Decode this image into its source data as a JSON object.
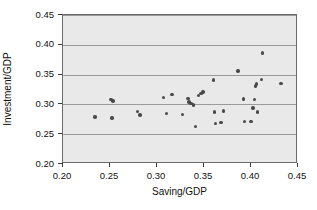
{
  "chart_data": {
    "type": "scatter",
    "title": "",
    "xlabel": "Saving/GDP",
    "ylabel": "Investment/GDP",
    "xlim": [
      0.2,
      0.45
    ],
    "ylim": [
      0.2,
      0.45
    ],
    "xticks": [
      "0.20",
      "0.25",
      "0.30",
      "0.35",
      "0.40",
      "0.45"
    ],
    "xtick_values": [
      0.2,
      0.25,
      0.3,
      0.35,
      0.4,
      0.45
    ],
    "yticks": [
      "0.20",
      "0.25",
      "0.30",
      "0.35",
      "0.40",
      "0.45"
    ],
    "ytick_values": [
      0.2,
      0.25,
      0.3,
      0.35,
      0.4,
      0.45
    ],
    "grid": "horizontal",
    "legend": "none",
    "marker": "filled-circle",
    "marker_color": "#4a4a4a",
    "plot_background": "#e9e9e9",
    "gridline_color": "#9a9a9a",
    "points": [
      {
        "x": 0.234,
        "y": 0.279
      },
      {
        "x": 0.251,
        "y": 0.308
      },
      {
        "x": 0.253,
        "y": 0.306
      },
      {
        "x": 0.252,
        "y": 0.277
      },
      {
        "x": 0.279,
        "y": 0.288
      },
      {
        "x": 0.282,
        "y": 0.282
      },
      {
        "x": 0.307,
        "y": 0.312
      },
      {
        "x": 0.31,
        "y": 0.285
      },
      {
        "x": 0.316,
        "y": 0.317
      },
      {
        "x": 0.327,
        "y": 0.283
      },
      {
        "x": 0.333,
        "y": 0.31
      },
      {
        "x": 0.334,
        "y": 0.304
      },
      {
        "x": 0.336,
        "y": 0.302
      },
      {
        "x": 0.339,
        "y": 0.299
      },
      {
        "x": 0.341,
        "y": 0.263
      },
      {
        "x": 0.344,
        "y": 0.315
      },
      {
        "x": 0.347,
        "y": 0.318
      },
      {
        "x": 0.349,
        "y": 0.321
      },
      {
        "x": 0.36,
        "y": 0.341
      },
      {
        "x": 0.361,
        "y": 0.287
      },
      {
        "x": 0.362,
        "y": 0.268
      },
      {
        "x": 0.368,
        "y": 0.27
      },
      {
        "x": 0.371,
        "y": 0.289
      },
      {
        "x": 0.386,
        "y": 0.356
      },
      {
        "x": 0.392,
        "y": 0.309
      },
      {
        "x": 0.393,
        "y": 0.271
      },
      {
        "x": 0.4,
        "y": 0.271
      },
      {
        "x": 0.402,
        "y": 0.294
      },
      {
        "x": 0.404,
        "y": 0.308
      },
      {
        "x": 0.405,
        "y": 0.331
      },
      {
        "x": 0.406,
        "y": 0.334
      },
      {
        "x": 0.407,
        "y": 0.287
      },
      {
        "x": 0.411,
        "y": 0.342
      },
      {
        "x": 0.412,
        "y": 0.386
      },
      {
        "x": 0.432,
        "y": 0.335
      }
    ]
  }
}
